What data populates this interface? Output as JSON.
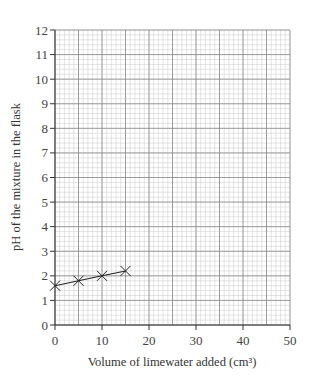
{
  "chart_data": {
    "type": "line",
    "title": "",
    "xlabel": "Volume of limewater added (cm³)",
    "ylabel": "pH of the mixture in the flask",
    "xlim": [
      0,
      50
    ],
    "ylim": [
      0,
      12
    ],
    "x_ticks": [
      0,
      10,
      20,
      30,
      40,
      50
    ],
    "y_ticks": [
      0,
      1,
      2,
      3,
      4,
      5,
      6,
      7,
      8,
      9,
      10,
      11,
      12
    ],
    "grid": true,
    "grid_minor_x_step": 1,
    "grid_minor_y_step": 0.2,
    "grid_major_x_step": 5,
    "grid_major_y_step": 1,
    "legend": null,
    "marker": "x",
    "series": [
      {
        "name": "pH",
        "x": [
          0,
          5,
          10,
          15
        ],
        "y": [
          1.6,
          1.8,
          2.0,
          2.2
        ]
      }
    ]
  },
  "colors": {
    "minor_grid": "#c8c8c8",
    "major_grid": "#8a8a8a",
    "axis": "#333333",
    "line": "#222222"
  }
}
